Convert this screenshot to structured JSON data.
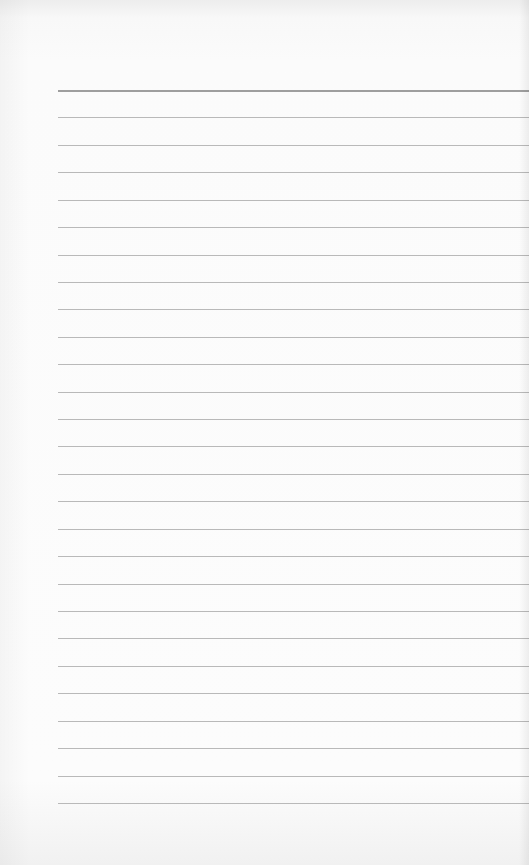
{
  "notepad": {
    "description": "Blank ruled notepad page",
    "line_count": 27,
    "first_line_y": 90,
    "line_spacing": 27.42,
    "line_left": 58,
    "colors": {
      "paper": "#fbfbfb",
      "rule": "#b9b9b9",
      "top_rule": "#9e9e9e"
    }
  }
}
